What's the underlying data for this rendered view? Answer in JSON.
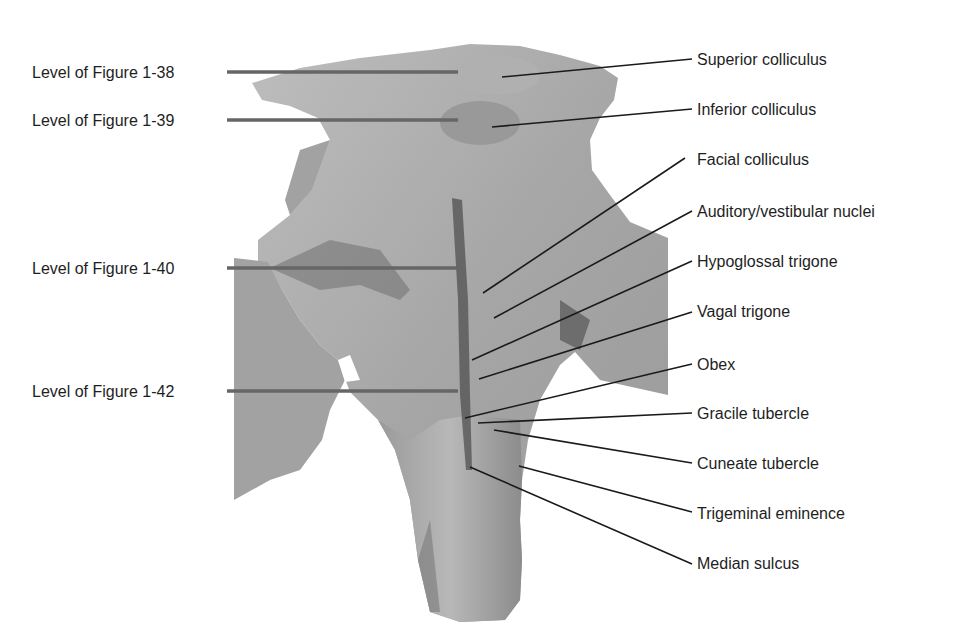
{
  "figure": {
    "colors": {
      "background": "#ffffff",
      "specimen_base": "#a9a9a9",
      "specimen_light": "#c4c4c4",
      "specimen_dark": "#6e6e6e",
      "level_line": "#666666",
      "leader_line": "#1a1a1a",
      "text": "#1e1e1e"
    },
    "level_labels": [
      {
        "label": "Level of Figure 1-38",
        "y": 72
      },
      {
        "label": "Level of Figure 1-39",
        "y": 120
      },
      {
        "label": "Level of Figure 1-40",
        "y": 268
      },
      {
        "label": "Level of Figure 1-42",
        "y": 391
      }
    ],
    "structure_labels": [
      {
        "label": "Superior colliculus",
        "y": 59
      },
      {
        "label": "Inferior colliculus",
        "y": 109
      },
      {
        "label": "Facial colliculus",
        "y": 159
      },
      {
        "label": "Auditory/vestibular nuclei",
        "y": 211
      },
      {
        "label": "Hypoglossal trigone",
        "y": 261
      },
      {
        "label": "Vagal trigone",
        "y": 311
      },
      {
        "label": "Obex",
        "y": 364
      },
      {
        "label": "Gracile tubercle",
        "y": 413
      },
      {
        "label": "Cuneate tubercle",
        "y": 463
      },
      {
        "label": "Trigeminal eminence",
        "y": 513
      },
      {
        "label": "Median sulcus",
        "y": 563
      }
    ]
  }
}
